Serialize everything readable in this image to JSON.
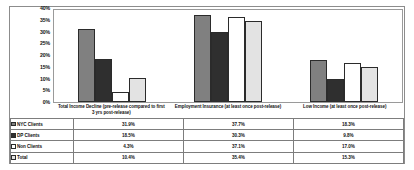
{
  "chart_data": {
    "type": "bar",
    "title": "",
    "xlabel": "",
    "ylabel": "",
    "ylim": [
      0,
      40
    ],
    "ytick_labels": [
      "40%",
      "35%",
      "30%",
      "25%",
      "20%",
      "15%",
      "10%",
      "5%",
      "0%"
    ],
    "ytick_values": [
      40,
      35,
      30,
      25,
      20,
      15,
      10,
      5,
      0
    ],
    "grid": false,
    "legend_position": "table-below",
    "categories": [
      "Total Income Decline (pre-release compared to first 3 yrs post-release)",
      "Employment Insurance (at least once post-release)",
      "Low Income (at least once post-release)"
    ],
    "series": [
      {
        "name": "NYC Clients",
        "color": "#808080",
        "values": [
          31.9,
          37.7,
          18.3
        ],
        "labels": [
          "31.9%",
          "37.7%",
          "18.3%"
        ]
      },
      {
        "name": "DP Clients",
        "color": "#2f2f2f",
        "values": [
          18.5,
          30.3,
          9.8
        ],
        "labels": [
          "18.5%",
          "30.3%",
          "9.8%"
        ]
      },
      {
        "name": "Non Clients",
        "color": "#ffffff",
        "values": [
          4.3,
          37.1,
          17.0
        ],
        "labels": [
          "4.3%",
          "37.1%",
          "17.0%"
        ]
      },
      {
        "name": "Total",
        "color": "#e3e3e3",
        "values": [
          10.4,
          35.4,
          15.3
        ],
        "labels": [
          "10.4%",
          "35.4%",
          "15.3%"
        ]
      }
    ]
  }
}
